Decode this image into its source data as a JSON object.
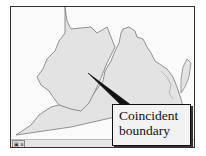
{
  "map": {
    "regions": [
      "west-virginia",
      "virginia",
      "delmarva-peninsula"
    ],
    "fill_color": "#e3e3e3",
    "border_color": "#777777",
    "background_color": "#fafafa"
  },
  "callout": {
    "line1": "Coincident",
    "line2": "boundary",
    "pointer_color": "#111111"
  },
  "statusbar": {
    "tag": "▣ a"
  }
}
